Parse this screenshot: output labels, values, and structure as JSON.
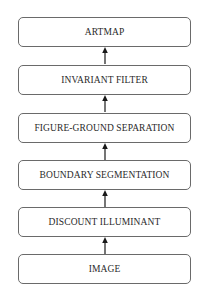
{
  "diagram": {
    "type": "flowchart",
    "direction": "bottom-to-top",
    "nodes": [
      {
        "id": "artmap",
        "label": "ARTMAP"
      },
      {
        "id": "invariant_filter",
        "label": "INVARIANT FILTER"
      },
      {
        "id": "figure_ground",
        "label": "FIGURE-GROUND SEPARATION"
      },
      {
        "id": "boundary_seg",
        "label": "BOUNDARY SEGMENTATION"
      },
      {
        "id": "discount_illum",
        "label": "DISCOUNT ILLUMINANT"
      },
      {
        "id": "image",
        "label": "IMAGE"
      }
    ],
    "edges": [
      {
        "from": "image",
        "to": "discount_illum"
      },
      {
        "from": "discount_illum",
        "to": "boundary_seg"
      },
      {
        "from": "boundary_seg",
        "to": "figure_ground"
      },
      {
        "from": "figure_ground",
        "to": "invariant_filter"
      },
      {
        "from": "invariant_filter",
        "to": "artmap"
      }
    ],
    "colors": {
      "stroke": "#6a6a6a",
      "text": "#2a2a2a",
      "arrow": "#1a1a1a",
      "background": "#ffffff"
    }
  }
}
